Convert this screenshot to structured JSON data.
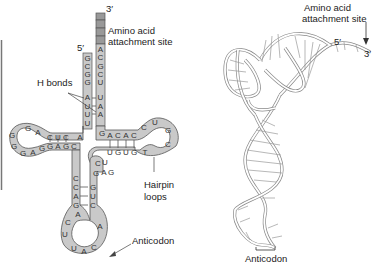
{
  "left_diagram": {
    "title": "tRNA cloverleaf secondary structure",
    "labels": {
      "three_prime": "3′",
      "five_prime": "5′",
      "amino_acid_site_line1": "Amino acid",
      "amino_acid_site_line2": "attachment site",
      "h_bonds": "H bonds",
      "hairpin_line1": "Hairpin",
      "hairpin_line2": "loops",
      "anticodon": "Anticodon"
    },
    "acceptor_stem": {
      "five_prime_strand": [
        "G",
        "C",
        "G",
        "G",
        "A",
        "U",
        "U",
        "U"
      ],
      "three_prime_strand": [
        "A",
        "C",
        "G",
        "C",
        "U",
        "U",
        "A",
        "A"
      ]
    },
    "left_arm": {
      "top_strand": [
        "A",
        "C",
        "U",
        "C",
        "A",
        "G"
      ],
      "loop": [
        "G",
        "G",
        "G",
        "A",
        "G",
        "G"
      ],
      "bottom_strand": [
        "G",
        "A",
        "G",
        "C"
      ]
    },
    "right_arm": {
      "top_strand": [
        "G",
        "A",
        "C",
        "A",
        "C"
      ],
      "loop": [
        "C",
        "U",
        "G",
        "C",
        "T"
      ],
      "bottom_strand": [
        "U",
        "G",
        "U",
        "G"
      ]
    },
    "variable_loop": [
      "C",
      "U",
      "G",
      "A",
      "G"
    ],
    "anticodon_arm": {
      "left_strand": [
        "C",
        "C",
        "A",
        "G",
        "A"
      ],
      "right_strand": [
        "G",
        "U",
        "C",
        "A"
      ],
      "loop": [
        "C",
        "U",
        "U",
        "A",
        "C"
      ],
      "anticodon_bases": [
        "U",
        "A",
        "C"
      ]
    },
    "colors": {
      "base_fill": "#c9c9c9",
      "outline": "#555555",
      "accent_dark": "#888888"
    }
  },
  "right_diagram": {
    "title": "tRNA 3D L-shaped ribbon structure",
    "labels": {
      "amino_acid_site_line1": "Amino acid",
      "amino_acid_site_line2": "attachment site",
      "five_prime": "5′",
      "three_prime": "3′",
      "anticodon": "Anticodon"
    }
  }
}
